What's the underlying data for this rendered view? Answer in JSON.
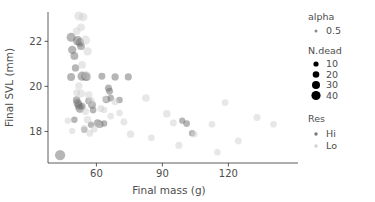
{
  "chart_data": {
    "type": "scatter",
    "title": "",
    "xlabel": "Final mass (g)",
    "ylabel": "Final SVL (mm)",
    "xlim": [
      38,
      148
    ],
    "ylim": [
      16.6,
      23.3
    ],
    "xticks": [
      60,
      90,
      120
    ],
    "yticks": [
      18,
      20,
      22
    ],
    "grid": false,
    "legend_position": "right",
    "size_variable": "N.dead",
    "color_variable": "Res",
    "alpha": 0.5,
    "colors": {
      "Hi": "#6e6e6e",
      "Lo": "#cfcfcf",
      "axis": "#333333",
      "text": "#4d4d4d"
    },
    "series": [
      {
        "name": "Hi",
        "color": "#6e6e6e",
        "points": [
          {
            "x": 43.5,
            "y": 16.95,
            "n": 33
          },
          {
            "x": 48.5,
            "y": 22.18,
            "n": 22
          },
          {
            "x": 49.0,
            "y": 21.62,
            "n": 17
          },
          {
            "x": 50.0,
            "y": 21.35,
            "n": 14
          },
          {
            "x": 50.5,
            "y": 20.82,
            "n": 11
          },
          {
            "x": 48.5,
            "y": 20.42,
            "n": 15
          },
          {
            "x": 51.5,
            "y": 22.02,
            "n": 26
          },
          {
            "x": 52.5,
            "y": 21.95,
            "n": 19
          },
          {
            "x": 53.0,
            "y": 21.78,
            "n": 13
          },
          {
            "x": 53.5,
            "y": 20.45,
            "n": 24
          },
          {
            "x": 55.0,
            "y": 20.45,
            "n": 20
          },
          {
            "x": 55.5,
            "y": 20.42,
            "n": 16
          },
          {
            "x": 51.0,
            "y": 19.4,
            "n": 12
          },
          {
            "x": 51.5,
            "y": 19.25,
            "n": 18
          },
          {
            "x": 52.0,
            "y": 19.15,
            "n": 15
          },
          {
            "x": 52.5,
            "y": 19.02,
            "n": 21
          },
          {
            "x": 53.5,
            "y": 19.12,
            "n": 10
          },
          {
            "x": 50.0,
            "y": 18.52,
            "n": 7
          },
          {
            "x": 56.5,
            "y": 19.35,
            "n": 9
          },
          {
            "x": 58.0,
            "y": 19.18,
            "n": 14
          },
          {
            "x": 58.5,
            "y": 18.95,
            "n": 8
          },
          {
            "x": 60.5,
            "y": 18.38,
            "n": 11
          },
          {
            "x": 61.5,
            "y": 18.32,
            "n": 13
          },
          {
            "x": 63.5,
            "y": 18.35,
            "n": 7
          },
          {
            "x": 64.5,
            "y": 19.42,
            "n": 12
          },
          {
            "x": 65.5,
            "y": 19.92,
            "n": 10
          },
          {
            "x": 66.0,
            "y": 19.78,
            "n": 9
          },
          {
            "x": 66.5,
            "y": 19.48,
            "n": 8
          },
          {
            "x": 68.5,
            "y": 20.42,
            "n": 11
          },
          {
            "x": 70.5,
            "y": 19.4,
            "n": 7
          },
          {
            "x": 74.5,
            "y": 20.42,
            "n": 10
          },
          {
            "x": 62.5,
            "y": 20.45,
            "n": 9
          },
          {
            "x": 54.5,
            "y": 18.08,
            "n": 6
          },
          {
            "x": 57.5,
            "y": 18.3,
            "n": 6
          },
          {
            "x": 101.0,
            "y": 18.35,
            "n": 8
          },
          {
            "x": 99.0,
            "y": 18.48,
            "n": 6
          },
          {
            "x": 103.5,
            "y": 17.92,
            "n": 7
          }
        ]
      },
      {
        "name": "Lo",
        "color": "#cfcfcf",
        "points": [
          {
            "x": 52.0,
            "y": 23.12,
            "n": 22
          },
          {
            "x": 54.0,
            "y": 23.08,
            "n": 18
          },
          {
            "x": 53.0,
            "y": 22.62,
            "n": 14
          },
          {
            "x": 55.0,
            "y": 22.05,
            "n": 24
          },
          {
            "x": 56.0,
            "y": 21.55,
            "n": 16
          },
          {
            "x": 51.0,
            "y": 22.45,
            "n": 12
          },
          {
            "x": 53.5,
            "y": 20.95,
            "n": 13
          },
          {
            "x": 55.5,
            "y": 20.48,
            "n": 19
          },
          {
            "x": 52.0,
            "y": 20.02,
            "n": 11
          },
          {
            "x": 53.0,
            "y": 19.68,
            "n": 15
          },
          {
            "x": 51.0,
            "y": 19.72,
            "n": 9
          },
          {
            "x": 56.5,
            "y": 19.62,
            "n": 12
          },
          {
            "x": 57.5,
            "y": 19.35,
            "n": 14
          },
          {
            "x": 55.0,
            "y": 18.88,
            "n": 10
          },
          {
            "x": 56.0,
            "y": 18.52,
            "n": 13
          },
          {
            "x": 54.5,
            "y": 18.12,
            "n": 11
          },
          {
            "x": 57.0,
            "y": 17.92,
            "n": 9
          },
          {
            "x": 47.0,
            "y": 18.48,
            "n": 7
          },
          {
            "x": 49.0,
            "y": 18.02,
            "n": 6
          },
          {
            "x": 59.0,
            "y": 18.1,
            "n": 8
          },
          {
            "x": 62.0,
            "y": 19.02,
            "n": 9
          },
          {
            "x": 63.5,
            "y": 18.95,
            "n": 7
          },
          {
            "x": 66.5,
            "y": 18.68,
            "n": 8
          },
          {
            "x": 68.5,
            "y": 19.32,
            "n": 10
          },
          {
            "x": 70.5,
            "y": 18.82,
            "n": 7
          },
          {
            "x": 72.5,
            "y": 18.42,
            "n": 9
          },
          {
            "x": 75.5,
            "y": 17.88,
            "n": 11
          },
          {
            "x": 82.5,
            "y": 19.48,
            "n": 12
          },
          {
            "x": 85.0,
            "y": 17.72,
            "n": 8
          },
          {
            "x": 92.0,
            "y": 18.78,
            "n": 13
          },
          {
            "x": 95.0,
            "y": 18.38,
            "n": 9
          },
          {
            "x": 97.5,
            "y": 17.38,
            "n": 10
          },
          {
            "x": 104.5,
            "y": 17.88,
            "n": 7
          },
          {
            "x": 112.5,
            "y": 18.32,
            "n": 8
          },
          {
            "x": 115.0,
            "y": 17.08,
            "n": 7
          },
          {
            "x": 118.5,
            "y": 19.28,
            "n": 9
          },
          {
            "x": 124.5,
            "y": 17.58,
            "n": 8
          },
          {
            "x": 133.0,
            "y": 18.62,
            "n": 10
          },
          {
            "x": 140.5,
            "y": 18.32,
            "n": 8
          },
          {
            "x": 61.0,
            "y": 18.32,
            "n": 6
          },
          {
            "x": 64.0,
            "y": 19.45,
            "n": 6
          }
        ]
      }
    ],
    "legend": {
      "alpha": {
        "title": "alpha",
        "entries": [
          {
            "label": "0.5"
          }
        ]
      },
      "n_dead": {
        "title": "N.dead",
        "entries": [
          {
            "label": "10"
          },
          {
            "label": "20"
          },
          {
            "label": "30"
          },
          {
            "label": "40"
          }
        ]
      },
      "res": {
        "title": "Res",
        "entries": [
          {
            "label": "Hi"
          },
          {
            "label": "Lo"
          }
        ]
      }
    }
  }
}
